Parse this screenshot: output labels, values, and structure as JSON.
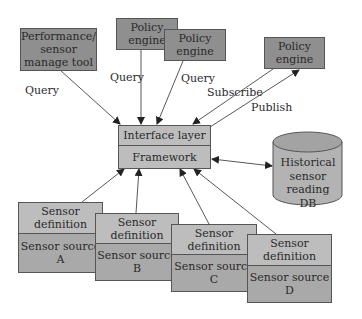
{
  "diagram": {
    "nodes": {
      "perf_tool": {
        "label": "Performance/ sensor manage tool"
      },
      "policy1": {
        "label": "Policy engine"
      },
      "policy2": {
        "label": "Policy engine"
      },
      "policy3": {
        "label": "Policy engine"
      },
      "interface": {
        "top": "Interface layer",
        "bottom": "Framework"
      },
      "db": {
        "label": "Historical sensor reading DB"
      },
      "sensors": [
        {
          "definition": "Sensor definition",
          "source": "Sensor source",
          "id": "A"
        },
        {
          "definition": "Sensor definition",
          "source": "Sensor source",
          "id": "B"
        },
        {
          "definition": "Sensor definition",
          "source": "Sensor source",
          "id": "C"
        },
        {
          "definition": "Sensor definition",
          "source": "Sensor source",
          "id": "D"
        }
      ]
    },
    "edges": {
      "q1": "Query",
      "q2": "Query",
      "q3": "Query",
      "subscribe": "Subscribe",
      "publish": "Publish"
    },
    "colors": {
      "dark_box": "#8f8f8f",
      "mid_box": "#a9a9a9",
      "light_box": "#bdbdbd",
      "line": "#444444"
    }
  }
}
